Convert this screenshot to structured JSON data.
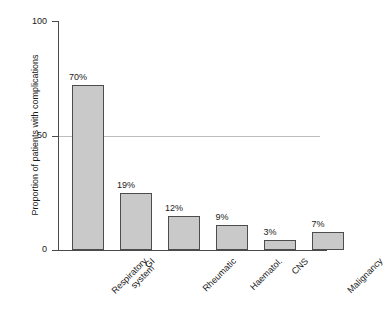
{
  "chart_data": {
    "type": "bar",
    "title": "",
    "subtitle": "",
    "xlabel": "",
    "ylabel": "Proportion of patients with complications",
    "ylim": [
      0,
      100
    ],
    "yticks": [
      0,
      50,
      100
    ],
    "ytick_labels": [
      "0",
      "50",
      "100"
    ],
    "grid": "horizontal gridline at y=50 only",
    "legend": "none",
    "orientation": "vertical",
    "bar_color": "#c9c9c9",
    "bar_edge_color": "#4d4d4d",
    "axis_color": "#4a4a4a",
    "gridline_color": "#bdbdbd",
    "background": "#ffffff",
    "categories": [
      "Respiratory system",
      "GI",
      "Rheumatic",
      "Haematol.",
      "CNS",
      "Malignancy"
    ],
    "values": [
      70,
      19,
      12,
      9,
      3,
      7
    ],
    "data_labels": [
      "70%",
      "19%",
      "12%",
      "9%",
      "3%",
      "7%"
    ],
    "drawn_bar_heights": [
      72,
      25,
      15,
      11,
      4.5,
      8
    ]
  },
  "axis": {
    "y_title": "Proportion of patients with complications",
    "tick_100": "100",
    "tick_50": "50",
    "tick_0": "0"
  },
  "categories": [
    {
      "line1": "Respiratory",
      "line2": "system"
    },
    {
      "line1": "GI",
      "line2": ""
    },
    {
      "line1": "Rheumatic",
      "line2": ""
    },
    {
      "line1": "Haematol.",
      "line2": ""
    },
    {
      "line1": "CNS",
      "line2": ""
    },
    {
      "line1": "Malignancy",
      "line2": ""
    }
  ],
  "bars": [
    {
      "label": "70%"
    },
    {
      "label": "19%"
    },
    {
      "label": "12%"
    },
    {
      "label": "9%"
    },
    {
      "label": "3%"
    },
    {
      "label": "7%"
    }
  ]
}
